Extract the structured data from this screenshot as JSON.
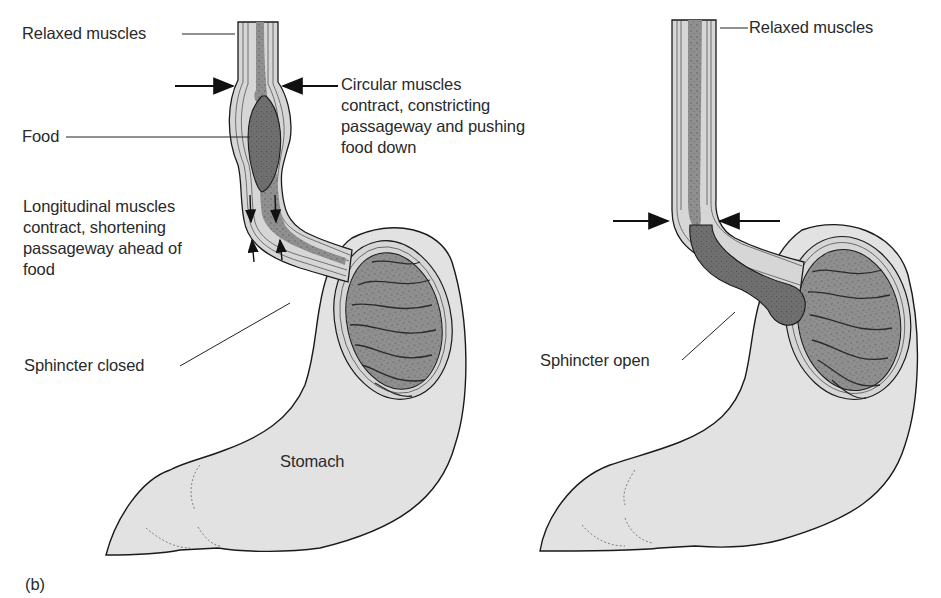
{
  "figure": {
    "panel_label": "(b)",
    "colors": {
      "background": "#ffffff",
      "stomach_fill": "#e2e2e2",
      "mucosa_fill": "#8f8f8f",
      "food_fill": "#6f6f6f",
      "muscle_fill": "#d6d6d6",
      "outline": "#1a1a1a"
    }
  },
  "left_panel": {
    "title": "Peristalsis with sphincter closed",
    "labels": {
      "relaxed_muscles": "Relaxed muscles",
      "circular_muscles": "Circular muscles\ncontract, constricting\npassageway and pushing\nfood down",
      "food": "Food",
      "longitudinal_muscles": "Longitudinal muscles\ncontract, shortening\npassageway ahead of\nfood",
      "sphincter": "Sphincter closed",
      "stomach": "Stomach"
    }
  },
  "right_panel": {
    "title": "Sphincter open",
    "labels": {
      "relaxed_muscles": "Relaxed muscles",
      "sphincter": "Sphincter open"
    }
  }
}
